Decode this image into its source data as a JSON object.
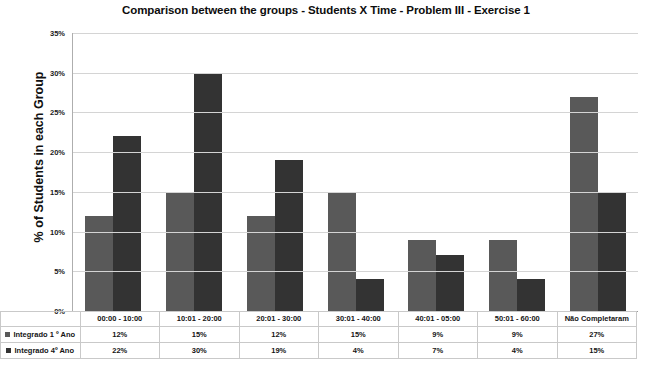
{
  "chart_data": {
    "type": "bar",
    "title": "Comparison between the groups - Students X Time - Problem III - Exercise 1",
    "xlabel": "",
    "ylabel": "% of Students in each Group",
    "ylim": [
      0,
      35
    ],
    "ytick_labels": [
      "35%",
      "30%",
      "25%",
      "20%",
      "15%",
      "10%",
      "5%",
      "0%"
    ],
    "ytick_values": [
      35,
      30,
      25,
      20,
      15,
      10,
      5,
      0
    ],
    "grid": true,
    "legend_position": "data-table-left",
    "categories": [
      "00:00 - 10:00",
      "10:01 - 20:00",
      "20:01 - 30:00",
      "30:01 - 40:00",
      "40:01 - 05:00",
      "50:01 - 60:00",
      "Não Completaram"
    ],
    "series": [
      {
        "name": "Integrado 1 º Ano",
        "color": "#595959",
        "values": [
          12,
          15,
          12,
          15,
          9,
          9,
          27
        ],
        "labels": [
          "12%",
          "15%",
          "12%",
          "15%",
          "9%",
          "9%",
          "27%"
        ]
      },
      {
        "name": "Integrado 4º Ano",
        "color": "#333333",
        "values": [
          22,
          30,
          19,
          4,
          7,
          4,
          15
        ],
        "labels": [
          "22%",
          "30%",
          "19%",
          "4%",
          "7%",
          "4%",
          "15%"
        ]
      }
    ]
  }
}
